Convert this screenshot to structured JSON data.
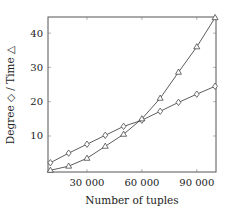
{
  "chart_data": {
    "type": "line",
    "title": "",
    "xlabel": "Number of tuples",
    "ylabel": "Degree ◇ / Time △",
    "xlim": [
      8700,
      100500
    ],
    "ylim": [
      -0.5,
      44.7
    ],
    "grid": false,
    "legend": null,
    "x_ticks": [
      30000,
      60000,
      90000
    ],
    "x_tick_labels": [
      "30 000",
      "60 000",
      "90 000"
    ],
    "y_ticks": [
      10,
      20,
      30,
      40
    ],
    "y_tick_labels": [
      "10",
      "20",
      "30",
      "40"
    ],
    "x": [
      10000,
      20000,
      30000,
      40000,
      50000,
      60000,
      70000,
      80000,
      90000,
      100000
    ],
    "series": [
      {
        "name": "Degree",
        "marker": "diamond",
        "values": [
          2.2,
          5.0,
          7.6,
          10.2,
          12.8,
          14.6,
          17.2,
          19.8,
          22.2,
          24.5
        ]
      },
      {
        "name": "Time",
        "marker": "triangle",
        "values": [
          0.0,
          1.2,
          3.5,
          7.0,
          10.5,
          15.0,
          21.0,
          28.6,
          36.0,
          44.5
        ]
      }
    ]
  },
  "colors": {
    "line": "#333333",
    "axis": "#555555"
  }
}
